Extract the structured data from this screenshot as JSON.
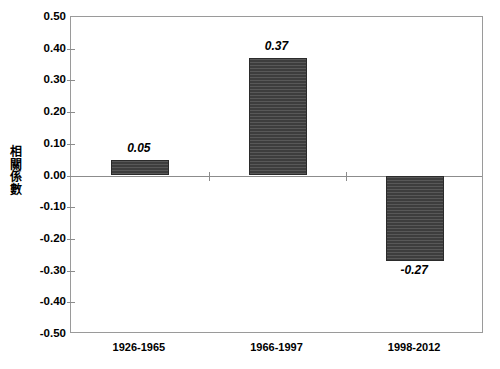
{
  "chart_data": {
    "type": "bar",
    "title": "",
    "subtitle": "",
    "xlabel": "",
    "ylabel": "相關係數",
    "ylabel_chars": [
      "相",
      "關",
      "係",
      "數"
    ],
    "categories": [
      "1926-1965",
      "1966-1997",
      "1998-2012"
    ],
    "values": [
      0.05,
      0.37,
      -0.27
    ],
    "value_labels": [
      "0.05",
      "0.37",
      "-0.27"
    ],
    "series": [
      {
        "name": "相關係數",
        "values": [
          0.05,
          0.37,
          -0.27
        ]
      }
    ],
    "ylim": [
      -0.5,
      0.5
    ],
    "ytick_values": [
      0.5,
      0.4,
      0.3,
      0.2,
      0.1,
      0.0,
      -0.1,
      -0.2,
      -0.3,
      -0.4,
      -0.5
    ],
    "ytick_labels": [
      "0.50",
      "0.40",
      "0.30",
      "0.20",
      "0.10",
      "0.00",
      "-0.10",
      "-0.20",
      "-0.30",
      "-0.40",
      "-0.50"
    ],
    "ytick_step": 0.1,
    "grid": false,
    "legend": "none",
    "bar_color": "#3d3d3d",
    "bar_pattern": "horizontal-stripes",
    "axis_color": "#8c8c8c",
    "frame_color": "#9a9a9a",
    "background_color": "#ffffff",
    "text_color": "#000000",
    "value_label_style": "bold-italic",
    "zero_baseline": 0.0
  }
}
